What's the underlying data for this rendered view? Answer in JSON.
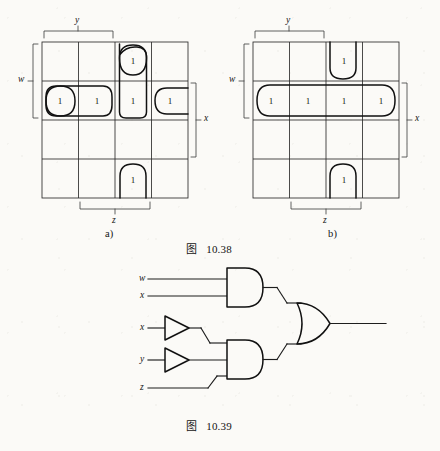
{
  "page": {
    "background_color": "#fbfaf7",
    "ink_color": "#151515"
  },
  "figures": [
    {
      "id": "figure-10-38",
      "caption_label": "图",
      "caption_number": "10.38",
      "subfigures": [
        {
          "id": "kmap-a",
          "sublabel": "a)",
          "type": "karnaugh-map",
          "variables": [
            "w",
            "x",
            "y",
            "z"
          ],
          "grid": {
            "rows": 4,
            "cols": 4
          },
          "bracket_labels": [
            {
              "name": "y",
              "text": "y",
              "position": "top",
              "spans_columns": [
                1,
                2
              ]
            },
            {
              "name": "w",
              "text": "w",
              "position": "left",
              "spans_rows": [
                1,
                2
              ]
            },
            {
              "name": "x",
              "text": "x",
              "position": "right",
              "spans_rows": [
                2,
                3
              ]
            },
            {
              "name": "z",
              "text": "z",
              "position": "bottom",
              "spans_columns": [
                2,
                3
              ]
            }
          ],
          "ones": [
            {
              "row": 1,
              "col": 3,
              "value": "1"
            },
            {
              "row": 2,
              "col": 1,
              "value": "1"
            },
            {
              "row": 2,
              "col": 2,
              "value": "1"
            },
            {
              "row": 2,
              "col": 3,
              "value": "1"
            },
            {
              "row": 2,
              "col": 4,
              "value": "1"
            },
            {
              "row": 4,
              "col": 3,
              "value": "1"
            }
          ],
          "groups": [
            {
              "name": "group-wrap-row2-col4-col1",
              "cells": "r2c4 + r2c1 (wrap)",
              "shape": "split-oval-horizontal"
            },
            {
              "name": "group-row2-col1-col2",
              "cells": "r2c1-r2c2",
              "shape": "oval-horizontal"
            },
            {
              "name": "group-col3-row1-row2",
              "cells": "r1c3-r2c3",
              "shape": "oval-vertical"
            },
            {
              "name": "group-wrap-col3-row4-row1",
              "cells": "r4c3 + r1c3 (wrap)",
              "shape": "split-oval-vertical"
            }
          ]
        },
        {
          "id": "kmap-b",
          "sublabel": "b)",
          "type": "karnaugh-map",
          "variables": [
            "w",
            "x",
            "y",
            "z"
          ],
          "grid": {
            "rows": 4,
            "cols": 4
          },
          "bracket_labels": [
            {
              "name": "y",
              "text": "y",
              "position": "top",
              "spans_columns": [
                1,
                2
              ]
            },
            {
              "name": "w",
              "text": "w",
              "position": "left",
              "spans_rows": [
                1,
                2
              ]
            },
            {
              "name": "x",
              "text": "x",
              "position": "right",
              "spans_rows": [
                2,
                3
              ]
            },
            {
              "name": "z",
              "text": "z",
              "position": "bottom",
              "spans_columns": [
                2,
                3
              ]
            }
          ],
          "ones": [
            {
              "row": 1,
              "col": 3,
              "value": "1"
            },
            {
              "row": 2,
              "col": 1,
              "value": "1"
            },
            {
              "row": 2,
              "col": 2,
              "value": "1"
            },
            {
              "row": 2,
              "col": 3,
              "value": "1"
            },
            {
              "row": 2,
              "col": 4,
              "value": "1"
            },
            {
              "row": 4,
              "col": 3,
              "value": "1"
            }
          ],
          "groups": [
            {
              "name": "group-row2-full",
              "cells": "r2c1-r2c4",
              "shape": "oval-horizontal-full-row"
            },
            {
              "name": "group-wrap-col3-row1-row4",
              "cells": "r1c3 + r4c3 (wrap)",
              "shape": "split-oval-vertical"
            }
          ]
        }
      ]
    },
    {
      "id": "figure-10-39",
      "caption_label": "图",
      "caption_number": "10.39",
      "type": "logic-circuit",
      "inputs": [
        {
          "name": "input-w",
          "label": "w"
        },
        {
          "name": "input-x-1",
          "label": "x"
        },
        {
          "name": "input-x-2",
          "label": "x"
        },
        {
          "name": "input-y",
          "label": "y"
        },
        {
          "name": "input-z",
          "label": "z"
        }
      ],
      "gates": [
        {
          "name": "and-gate-1",
          "type": "AND",
          "inputs": [
            "w",
            "x"
          ]
        },
        {
          "name": "not-gate-1",
          "type": "NOT",
          "inputs": [
            "x"
          ]
        },
        {
          "name": "not-gate-2",
          "type": "NOT",
          "inputs": [
            "y"
          ]
        },
        {
          "name": "and-gate-2",
          "type": "AND",
          "inputs": [
            "not-x",
            "not-y",
            "z"
          ]
        },
        {
          "name": "or-gate-1",
          "type": "OR",
          "inputs": [
            "and-gate-1",
            "and-gate-2"
          ]
        }
      ],
      "output": {
        "name": "circuit-output",
        "label": ""
      }
    }
  ]
}
